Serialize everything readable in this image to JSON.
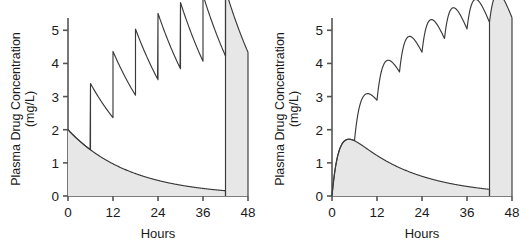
{
  "figure": {
    "shading_color": "#e7e7e7",
    "line_color": "#3a3a3a",
    "axis_color": "#555555"
  },
  "axes": {
    "y_title_line1": "Plasma Drug Concentration",
    "y_title_line2": "(mg/L)",
    "x_title": "Hours",
    "y_ticks": [
      "0",
      "1",
      "2",
      "3",
      "4",
      "5"
    ],
    "x_ticks": [
      "0",
      "12",
      "24",
      "36",
      "48"
    ]
  },
  "chart_data": [
    {
      "type": "line",
      "title": "",
      "xlabel": "Hours",
      "ylabel": "Plasma Drug Concentration (mg/L)",
      "xlim": [
        0,
        48
      ],
      "ylim": [
        0,
        5.25
      ],
      "xticks": [
        0,
        12,
        24,
        36,
        48
      ],
      "yticks": [
        0,
        1,
        2,
        3,
        4,
        5
      ],
      "grid": false,
      "legend": "none",
      "panel": "left",
      "administration": "intravenous-bolus",
      "dose_interval_hours": 6,
      "dose_times": [
        0,
        6,
        12,
        18,
        24,
        30,
        36,
        42
      ],
      "series": [
        {
          "name": "multiple-dose-sawtooth",
          "style": "line",
          "peaks": [
            2.0,
            3.3,
            4.1,
            4.6,
            4.85,
            5.0,
            5.1,
            5.2
          ],
          "troughs": [
            1.2,
            2.05,
            2.6,
            2.95,
            3.1,
            3.2,
            3.3
          ],
          "final_value_at_48h": 3.2
        },
        {
          "name": "single-dose-shaded",
          "style": "area",
          "shaded": true,
          "initial_value": 2.0,
          "value_at_12h": 0.98,
          "value_at_24h": 0.45,
          "value_at_36h": 0.2,
          "value_at_42h": 0.12,
          "half_life_hours": 11.5
        }
      ]
    },
    {
      "type": "line",
      "title": "",
      "xlabel": "Hours",
      "ylabel": "Plasma Drug Concentration (mg/L)",
      "xlim": [
        0,
        48
      ],
      "ylim": [
        0,
        5.25
      ],
      "xticks": [
        0,
        12,
        24,
        36,
        48
      ],
      "yticks": [
        0,
        1,
        2,
        3,
        4,
        5
      ],
      "grid": false,
      "legend": "none",
      "panel": "right",
      "administration": "oral",
      "dose_interval_hours": 6,
      "dose_times": [
        0,
        6,
        12,
        18,
        24,
        30,
        36,
        42
      ],
      "series": [
        {
          "name": "multiple-dose-oral",
          "style": "line",
          "peaks": [
            1.55,
            2.7,
            3.5,
            4.0,
            4.35,
            4.5,
            4.6,
            4.65
          ],
          "troughs": [
            2.4,
            3.05,
            3.5,
            3.8,
            4.0,
            4.15
          ],
          "final_value_at_48h": 4.1
        },
        {
          "name": "single-dose-shaded",
          "style": "area",
          "shaded": true,
          "peak_value": 1.55,
          "time_to_peak_hours": 6,
          "value_at_12h": 1.15,
          "value_at_24h": 0.62,
          "value_at_36h": 0.28,
          "value_at_42h": 0.14,
          "half_life_hours": 11.5
        }
      ]
    }
  ]
}
